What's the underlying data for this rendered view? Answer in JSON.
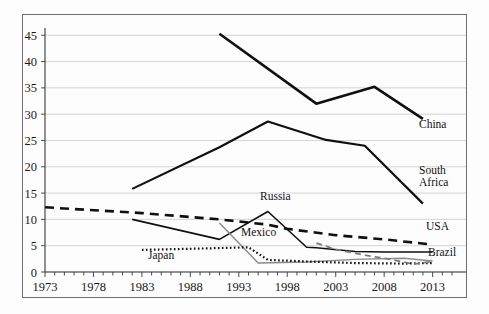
{
  "chart_data": {
    "type": "line",
    "title": "",
    "subtitle": "",
    "xlabel": "",
    "ylabel": "",
    "xlim": [
      1973,
      2015
    ],
    "ylim": [
      0,
      46
    ],
    "yticks": [
      0,
      5,
      10,
      15,
      20,
      25,
      30,
      35,
      40,
      45
    ],
    "xticks": [
      1973,
      1978,
      1983,
      1988,
      1993,
      1998,
      2003,
      2008,
      2013
    ],
    "xtick_labels": [
      "1973",
      "1978",
      "1983",
      "1988",
      "1993",
      "1998",
      "2003",
      "2008",
      "2013"
    ],
    "ytick_labels": [
      "0",
      "5",
      "10",
      "15",
      "20",
      "25",
      "30",
      "35",
      "40",
      "45"
    ],
    "minor_xtick_interval": 1,
    "grid": "horizontal",
    "legend_position": "inline-right-of-line-end",
    "series": [
      {
        "name": "China",
        "label": "China",
        "label_lines": [
          "China"
        ],
        "color": "#101010",
        "style": "solid",
        "width": 2.6,
        "x": [
          1991,
          2001,
          2007,
          2012
        ],
        "y": [
          45.3,
          32.0,
          35.2,
          29.1
        ]
      },
      {
        "name": "South Africa",
        "label": "South Africa",
        "label_lines": [
          "South",
          "Africa"
        ],
        "color": "#101010",
        "style": "solid",
        "width": 2.2,
        "x": [
          1982,
          1991,
          1996,
          2002,
          2006,
          2012
        ],
        "y": [
          15.8,
          23.7,
          28.6,
          25.1,
          24.0,
          13.0
        ]
      },
      {
        "name": "USA",
        "label": "USA",
        "label_lines": [
          "USA"
        ],
        "color": "#101010",
        "style": "dashed",
        "width": 2.6,
        "x": [
          1973,
          1983,
          1991,
          1996,
          1998,
          2003,
          2008,
          2013
        ],
        "y": [
          12.3,
          11.2,
          10.0,
          9.0,
          8.2,
          7.0,
          6.2,
          5.2
        ]
      },
      {
        "name": "Russia",
        "label": "Russia",
        "label_lines": [
          "Russia"
        ],
        "color": "#101010",
        "style": "solid",
        "width": 1.6,
        "x": [
          1982,
          1991,
          1996,
          2000,
          2001,
          2005,
          2008,
          2013
        ],
        "y": [
          10.0,
          6.2,
          11.5,
          4.7,
          4.6,
          3.9,
          3.8,
          3.8
        ]
      },
      {
        "name": "Mexico",
        "label": "Mexico",
        "label_lines": [
          "Mexico"
        ],
        "color": "#8a8a8a",
        "style": "solid",
        "width": 1.4,
        "x": [
          1991,
          1995,
          2000,
          2005,
          2010,
          2013
        ],
        "y": [
          9.3,
          1.7,
          1.9,
          2.4,
          2.6,
          2.1
        ]
      },
      {
        "name": "Japan",
        "label": "Japan",
        "label_lines": [
          "Japan"
        ],
        "color": "#111111",
        "style": "dotted",
        "width": 2.2,
        "x": [
          1983,
          1990,
          1994,
          1996,
          2000,
          2005,
          2010,
          2013
        ],
        "y": [
          4.2,
          4.5,
          4.7,
          2.3,
          2.0,
          1.7,
          1.6,
          1.7
        ]
      },
      {
        "name": "Brazil",
        "label": "Brazil",
        "label_lines": [
          "Brazil"
        ],
        "color": "#7d7d7d",
        "style": "dashed",
        "width": 1.8,
        "x": [
          2001,
          2003,
          2006,
          2009,
          2011,
          2013
        ],
        "y": [
          5.5,
          4.3,
          3.2,
          2.3,
          1.5,
          2.0
        ]
      }
    ],
    "annotations": [
      {
        "text": "China",
        "series": "China",
        "x_px": 419,
        "y_px": 128
      },
      {
        "text": "South",
        "series": "South Africa",
        "x_px": 419,
        "y_px": 174
      },
      {
        "text": "Africa",
        "series": "South Africa",
        "x_px": 419,
        "y_px": 186
      },
      {
        "text": "USA",
        "series": "USA",
        "x_px": 426,
        "y_px": 230
      },
      {
        "text": "Russia",
        "series": "Russia",
        "x_px": 260,
        "y_px": 200
      },
      {
        "text": "Mexico",
        "series": "Mexico",
        "x_px": 241,
        "y_px": 236
      },
      {
        "text": "Japan",
        "series": "Japan",
        "x_px": 148,
        "y_px": 259
      },
      {
        "text": "Brazil",
        "series": "Brazil",
        "x_px": 428,
        "y_px": 256
      }
    ]
  }
}
